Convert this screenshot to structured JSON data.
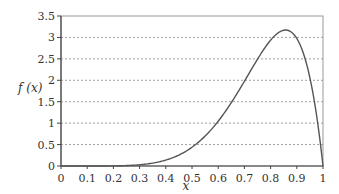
{
  "chart_data": {
    "type": "line",
    "title": "",
    "xlabel": "x",
    "ylabel": "f (x)",
    "xlim": [
      0,
      1
    ],
    "ylim": [
      0,
      3.5
    ],
    "x_ticks": [
      "0",
      "0.1",
      "0.2",
      "0.3",
      "0.4",
      "0.5",
      "0.6",
      "0.7",
      "0.8",
      "0.9",
      "1"
    ],
    "y_ticks": [
      "0",
      "0.5",
      "1",
      "1.5",
      "2",
      "2.5",
      "3",
      "3.5"
    ],
    "grid": "horizontal dashed",
    "legend": "none",
    "series": [
      {
        "name": "f(x)",
        "x": [
          0,
          0.1,
          0.2,
          0.3,
          0.4,
          0.5,
          0.6,
          0.7,
          0.75,
          0.8,
          0.85,
          0.857,
          0.9,
          0.95,
          1.0
        ],
        "values": [
          0,
          0.0001,
          0.003,
          0.029,
          0.138,
          0.44,
          1.05,
          1.98,
          2.49,
          2.94,
          3.17,
          3.17,
          2.98,
          2.06,
          0
        ]
      }
    ]
  },
  "colors": {
    "curve": "#555555",
    "grid": "#888888",
    "axis": "#444444",
    "frame": "#999999"
  }
}
